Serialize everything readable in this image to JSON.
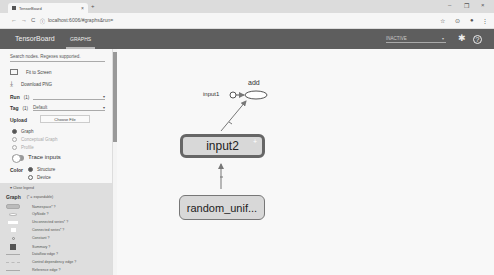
{
  "browser": {
    "tab_title": "TensorBoard",
    "tab_close": "×",
    "new_tab": "+",
    "url": "localhost:6006/#graphs&run=",
    "nav": {
      "back": "←",
      "forward": "→",
      "reload": "C",
      "info": "ⓘ"
    },
    "window_controls": {
      "minimize": "–",
      "maximize": "❐",
      "close": "×"
    },
    "addr_icons": {
      "star": "☆",
      "ext": "⊙",
      "profile": "●",
      "menu": "⋮"
    }
  },
  "toolbar": {
    "brand": "TensorBoard",
    "tabs": [
      {
        "label": "GRAPHS",
        "active": true
      }
    ],
    "run_selector": {
      "value": "INACTIVE",
      "caret": "▾"
    },
    "icons": {
      "settings": "✱",
      "help": "?"
    }
  },
  "sidebar": {
    "search_placeholder": "Search nodes. Regexes supported.",
    "actions": [
      {
        "label": "Fit to Screen"
      },
      {
        "label": "Download PNG"
      }
    ],
    "run": {
      "label": "Run",
      "count": "(1)",
      "value": ""
    },
    "tag": {
      "label": "Tag",
      "count": "(1)",
      "value": "Default"
    },
    "upload": {
      "label": "Upload",
      "button": "Choose File"
    },
    "graph_types": [
      {
        "label": "Graph",
        "selected": true,
        "disabled": false
      },
      {
        "label": "Conceptual Graph",
        "selected": false,
        "disabled": true
      },
      {
        "label": "Profile",
        "selected": false,
        "disabled": true
      }
    ],
    "trace_inputs": {
      "label": "Trace inputs",
      "on": false
    },
    "color": {
      "label": "Color",
      "options": [
        {
          "label": "Structure",
          "selected": true
        },
        {
          "label": "Device",
          "selected": false
        }
      ]
    }
  },
  "legend": {
    "toggle": "▾ Close legend",
    "title": "Graph",
    "subtitle": "(* = expandable)",
    "items": [
      {
        "label": "Namespace* ?"
      },
      {
        "label": "OpNode ?"
      },
      {
        "label": "Unconnected series* ?"
      },
      {
        "label": "Connected series* ?"
      },
      {
        "label": "Constant ?"
      },
      {
        "label": "Summary ?"
      },
      {
        "label": "Dataflow edge ?"
      },
      {
        "label": "Control dependency edge ?"
      },
      {
        "label": "Reference edge ?"
      }
    ]
  },
  "graph": {
    "nodes": [
      {
        "id": "add",
        "label": "add",
        "type": "op"
      },
      {
        "id": "input1",
        "label": "input1",
        "type": "constant"
      },
      {
        "id": "input2",
        "label": "input2",
        "type": "namespace",
        "selected": true,
        "expand": "+"
      },
      {
        "id": "random_unif",
        "label": "random_unif...",
        "type": "namespace"
      }
    ],
    "edges": [
      {
        "from": "input1",
        "to": "add"
      },
      {
        "from": "input2",
        "to": "add"
      },
      {
        "from": "random_unif",
        "to": "input2"
      }
    ]
  }
}
